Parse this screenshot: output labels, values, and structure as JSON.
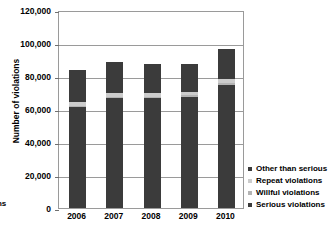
{
  "chart_data": {
    "type": "bar",
    "subtype": "stacked",
    "title": "",
    "xlabel": "",
    "ylabel": "Number of violations",
    "categories": [
      "2006",
      "2007",
      "2008",
      "2009",
      "2010"
    ],
    "ylim": [
      0,
      120000
    ],
    "ytick_values": [
      0,
      20000,
      40000,
      60000,
      80000,
      100000,
      120000
    ],
    "ytick_labels": [
      "0",
      "20,000",
      "40,000",
      "60,000",
      "80,000",
      "100,000",
      "120,000"
    ],
    "grid": true,
    "legend_position": "right-bottom",
    "series": [
      {
        "name": "Serious violations",
        "color": "#3b3b3b",
        "values": [
          61000,
          66500,
          66500,
          67500,
          74500
        ]
      },
      {
        "name": "Willful violations",
        "color": "#b4b4b4",
        "values": [
          1000,
          1000,
          1000,
          1000,
          1000
        ]
      },
      {
        "name": "Repeat violations",
        "color": "#cccccc",
        "values": [
          2500,
          2000,
          2000,
          2000,
          2500
        ]
      },
      {
        "name": "Other than serious",
        "color": "#3b3b3b",
        "values": [
          19000,
          19000,
          18000,
          16500,
          18500
        ]
      }
    ],
    "totals": [
      83500,
      88500,
      87500,
      87000,
      96500
    ],
    "annotations": []
  },
  "legend": {
    "items": [
      {
        "label": "Other than serious",
        "color": "#3b3b3b"
      },
      {
        "label": "Repeat violations",
        "color": "#cccccc"
      },
      {
        "label": "Willful violations",
        "color": "#b4b4b4"
      },
      {
        "label": "Serious violations",
        "color": "#3b3b3b"
      }
    ]
  },
  "edge_text": {
    "fragment_top": "s",
    "fragment_bottom": "ons"
  },
  "colors": {
    "axis": "#9a9a9a",
    "grid": "#9a9a9a",
    "background": "#ffffff",
    "text": "#000000"
  }
}
